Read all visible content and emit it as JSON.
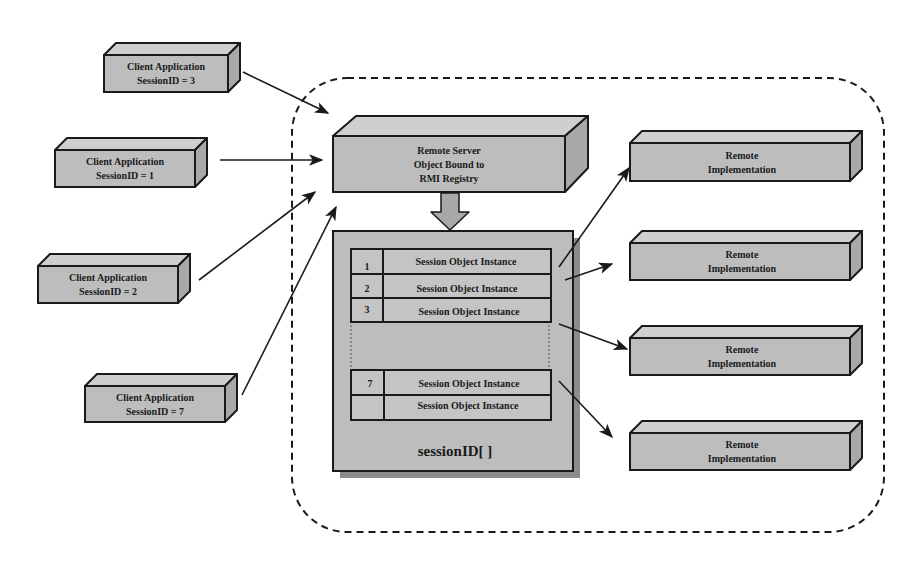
{
  "diagram": {
    "type": "architecture",
    "boundary": {
      "style": "dashed-rounded"
    },
    "clients": [
      {
        "id": "client-3",
        "line1": "Client Application",
        "line2": "SessionID = 3"
      },
      {
        "id": "client-1",
        "line1": "Client Application",
        "line2": "SessionID = 1"
      },
      {
        "id": "client-2",
        "line1": "Client Application",
        "line2": "SessionID = 2"
      },
      {
        "id": "client-7",
        "line1": "Client Application",
        "line2": "SessionID = 7"
      }
    ],
    "server": {
      "line1": "Remote Server",
      "line2": "Object Bound to",
      "line3": "RMI Registry"
    },
    "session_table": {
      "caption": "sessionID[ ]",
      "rows": [
        {
          "index": "1",
          "label": "Session Object Instance"
        },
        {
          "index": "2",
          "label": "Session Object Instance"
        },
        {
          "index": "3",
          "label": "Session Object Instance"
        },
        {
          "index": "7",
          "label": "Session Object Instance"
        },
        {
          "index": "",
          "label": "Session Object Instance"
        }
      ]
    },
    "implementations": [
      {
        "line1": "Remote",
        "line2": "Implementation"
      },
      {
        "line1": "Remote",
        "line2": "Implementation"
      },
      {
        "line1": "Remote",
        "line2": "Implementation"
      },
      {
        "line1": "Remote",
        "line2": "Implementation"
      }
    ],
    "colors": {
      "box_fill": "#bdbdbd",
      "box_top": "#cfcfcf",
      "box_side": "#a9a9a9",
      "stroke": "#1a1a1a",
      "shadow": "#8c8c8c",
      "background": "#ffffff"
    }
  }
}
